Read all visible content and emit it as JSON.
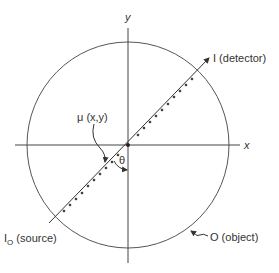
{
  "diagram": {
    "title": "",
    "axes": {
      "x_label": "x",
      "y_label": "y"
    },
    "labels": {
      "detector": "I (detector)",
      "source_main": "I",
      "source_sub": "O",
      "source_rest": " (source)",
      "object": "O (object)",
      "attenuation": "μ (x,y)",
      "angle": "θ"
    },
    "colors": {
      "stroke": "#333333",
      "background": "#ffffff"
    }
  }
}
